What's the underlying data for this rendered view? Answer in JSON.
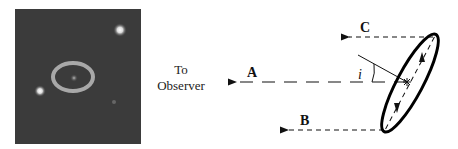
{
  "figure": {
    "photo": {
      "description": "Hubble image of SN 1987A circumstellar ring",
      "background_color": "#3a3a3a",
      "ring_color": "#9a9a9a",
      "stars": [
        {
          "name": "upper-right-star",
          "x": 120,
          "y": 30
        },
        {
          "name": "lower-left-star",
          "x": 40,
          "y": 91
        }
      ]
    },
    "observer_label": {
      "line1": "To",
      "line2": "Observer"
    },
    "rays": [
      {
        "label": "A",
        "description": "line of sight from ring center toward observer"
      },
      {
        "label": "B",
        "description": "ray from near edge of ring"
      },
      {
        "label": "C",
        "description": "ray from far edge of ring"
      }
    ],
    "angle_label": "i",
    "colors": {
      "line": "#111111",
      "ellipse_stroke": "#000000"
    }
  }
}
